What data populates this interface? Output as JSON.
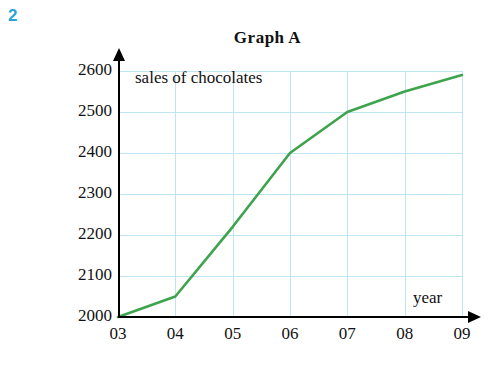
{
  "question_number": "2",
  "chart_data": {
    "type": "line",
    "title": "Graph  A",
    "series_label": "sales of chocolates",
    "xlabel": "year",
    "ylabel": "",
    "categories": [
      "03",
      "04",
      "05",
      "06",
      "07",
      "08",
      "09"
    ],
    "x": [
      3,
      4,
      5,
      6,
      7,
      8,
      9
    ],
    "values": [
      2000,
      2050,
      2220,
      2400,
      2500,
      2550,
      2590
    ],
    "xlim": [
      3,
      9
    ],
    "ylim": [
      2000,
      2600
    ],
    "ytick_labels": [
      "2000",
      "2100",
      "2200",
      "2300",
      "2400",
      "2500",
      "2600"
    ],
    "yticks": [
      2000,
      2100,
      2200,
      2300,
      2400,
      2500,
      2600
    ],
    "xtick_labels": [
      "03",
      "04",
      "05",
      "06",
      "07",
      "08",
      "09"
    ],
    "grid": true,
    "grid_color": "#bfe4f2",
    "line_color": "#3da34d",
    "axis_color": "#000000",
    "legend": "none"
  }
}
